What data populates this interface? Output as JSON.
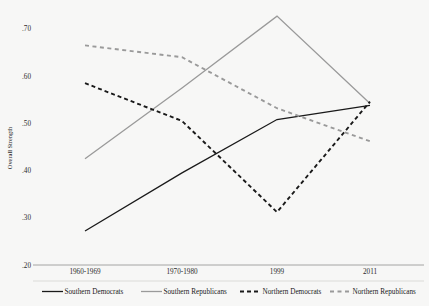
{
  "chart_data": {
    "type": "line",
    "title": "",
    "xlabel": "",
    "ylabel": "Overall Strength",
    "categories": [
      "1960-1969",
      "1970-1980",
      "1999",
      "2011"
    ],
    "ylim": [
      0.2,
      0.74
    ],
    "yticks": [
      0.2,
      0.3,
      0.4,
      0.5,
      0.6,
      0.7
    ],
    "ytick_labels": [
      ".20",
      ".30",
      ".40",
      ".50",
      ".60",
      ".70"
    ],
    "grid": false,
    "legend_position": "bottom",
    "series": [
      {
        "name": "Southern Democrats",
        "values": [
          0.272,
          0.395,
          0.508,
          0.538
        ],
        "color": "#1a1a1a",
        "style": "solid",
        "legend_key": "solid-black"
      },
      {
        "name": "Southern Republicans",
        "values": [
          0.425,
          0.575,
          0.727,
          0.542
        ],
        "color": "#9a9a9a",
        "style": "solid",
        "legend_key": "solid-gray"
      },
      {
        "name": "Northern Democrats",
        "values": [
          0.585,
          0.505,
          0.312,
          0.546
        ],
        "color": "#1a1a1a",
        "style": "dashed",
        "legend_key": "dashed-black"
      },
      {
        "name": "Northern Republicans",
        "values": [
          0.665,
          0.64,
          0.532,
          0.462
        ],
        "color": "#9a9a9a",
        "style": "dashed",
        "legend_key": "dashed-gray"
      }
    ]
  },
  "axis": {
    "y_title": "Overall Strength"
  },
  "colors": {
    "background": "#f7f7f6",
    "axis": "#9a9a9a",
    "dark_series": "#1a1a1a",
    "light_series": "#9a9a9a"
  }
}
